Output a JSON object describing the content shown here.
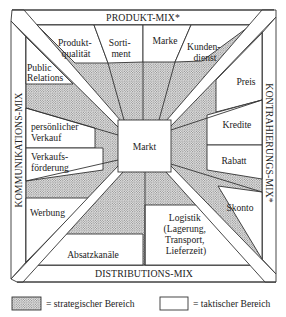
{
  "bands": {
    "top": "PRODUKT-MIX*",
    "left": "KOMMUNIKATIONS-MIX",
    "right": "KONTRAHIERUNGS-MIX*",
    "bottom": "DISTRIBUTIONS-MIX"
  },
  "center": "Markt",
  "produkt_mix": {
    "items": [
      {
        "lines": [
          "Produkt-",
          "qualität"
        ]
      },
      {
        "lines": [
          "Sorti-",
          "ment"
        ]
      },
      {
        "lines": [
          "Marke"
        ]
      },
      {
        "lines": [
          "Kunden-",
          "dienst"
        ]
      }
    ]
  },
  "kommunikations_mix": {
    "items": [
      {
        "lines": [
          "Public",
          "Relations"
        ]
      },
      {
        "lines": [
          "persönlicher",
          "Verkauf"
        ]
      },
      {
        "lines": [
          "Verkaufs-",
          "förderung"
        ]
      },
      {
        "lines": [
          "Werbung"
        ]
      }
    ]
  },
  "kontrahierungs_mix": {
    "items": [
      {
        "lines": [
          "Preis"
        ]
      },
      {
        "lines": [
          "Kredite"
        ]
      },
      {
        "lines": [
          "Rabatt"
        ]
      },
      {
        "lines": [
          "Skonto"
        ]
      }
    ]
  },
  "distributions_mix": {
    "items": [
      {
        "lines": [
          "Absatzkanäle"
        ]
      },
      {
        "lines": [
          "Logistik",
          "(Lagerung,",
          "Transport,",
          "Lieferzeit)"
        ]
      }
    ]
  },
  "legend": {
    "strategic": "= strategischer Bereich",
    "tactical": "= taktischer Bereich"
  }
}
